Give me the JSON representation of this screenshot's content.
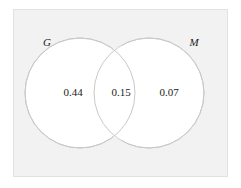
{
  "figure": {
    "type": "venn-diagram",
    "set_count": 2,
    "frame": {
      "fill_color": "#f2f2f2",
      "border_color": "#e2e2e2"
    },
    "circle": {
      "fill_color": "#ffffff",
      "stroke_color": "#c9c9c9"
    },
    "text_color": "#1a1a1a"
  },
  "sets": [
    {
      "name": "set-g",
      "label": "G"
    },
    {
      "name": "set-m",
      "label": "M"
    }
  ],
  "regions": [
    {
      "name": "left-only",
      "value": "0.44"
    },
    {
      "name": "intersection",
      "value": "0.15"
    },
    {
      "name": "right-only",
      "value": "0.07"
    }
  ]
}
